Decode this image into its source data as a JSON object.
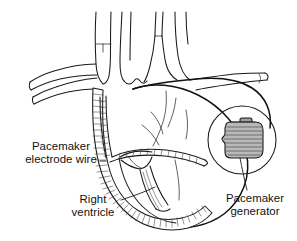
{
  "figure": {
    "background_color": "#ffffff",
    "ink_color": "#1a1a1a",
    "width": 297,
    "height": 241,
    "style": "black-and-white medical line illustration"
  },
  "labels": {
    "electrode_wire": {
      "line1": "Pacemaker",
      "line2": "electrode wire",
      "leader": "horizontal line to hatched lead inside heart"
    },
    "right_ventricle": {
      "line1": "Right",
      "line2": "ventricle",
      "leader": "diagonal line up-right to ventricle wall"
    },
    "generator": {
      "line1": "Pacemaker",
      "line2": "generator",
      "leader": "curved line up to implanted device"
    }
  },
  "anatomy": {
    "parts": [
      "superior vena cava",
      "aortic arch",
      "brachiocephalic veins",
      "left subclavian vein",
      "right subclavian vein",
      "right atrium",
      "right ventricle",
      "interventricular septum",
      "tricuspid valve",
      "papillary muscles",
      "heart apex"
    ]
  },
  "device": {
    "name": "pacemaker generator",
    "shape": "rounded rectangle with connector header",
    "fill_color": "#b9b9b9",
    "stripe_color": "#6f6f6f",
    "inset": "circular cutaway view"
  },
  "lead": {
    "name": "pacemaker electrode wire",
    "appearance": "hatched ladder-like line",
    "path": "from generator through subclavian vein and superior vena cava into right ventricle apex"
  }
}
